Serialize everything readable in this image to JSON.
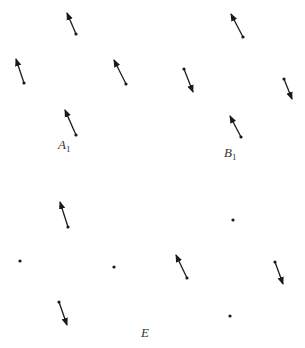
{
  "figure": {
    "width": 305,
    "height": 348,
    "background": "#ffffff",
    "stroke_color": "#1a1a1a",
    "groups": [
      {
        "id": "A1",
        "label": {
          "main": "A",
          "sub": "1",
          "x": 58,
          "y": 138
        },
        "vectors": [
          {
            "tail": [
              76,
              34
            ],
            "head": [
              67,
              13
            ]
          },
          {
            "tail": [
              24,
              83
            ],
            "head": [
              16,
              59
            ]
          },
          {
            "tail": [
              126,
              84
            ],
            "head": [
              114,
              60
            ]
          },
          {
            "tail": [
              76,
              135
            ],
            "head": [
              65,
              110
            ]
          }
        ],
        "points": []
      },
      {
        "id": "B1",
        "label": {
          "main": "B",
          "sub": "1",
          "x": 224,
          "y": 146
        },
        "vectors": [
          {
            "tail": [
              243,
              37
            ],
            "head": [
              231,
              14
            ]
          },
          {
            "tail": [
              184,
              69
            ],
            "head": [
              193,
              92
            ]
          },
          {
            "tail": [
              284,
              79
            ],
            "head": [
              292,
              99
            ]
          },
          {
            "tail": [
              241,
              137
            ],
            "head": [
              230,
              116
            ]
          }
        ],
        "points": []
      },
      {
        "id": "E",
        "label": {
          "main": "E",
          "sub": "",
          "x": 141,
          "y": 326
        },
        "vectors": [
          {
            "tail": [
              68,
              227
            ],
            "head": [
              60,
              202
            ]
          },
          {
            "tail": [
              59,
              302
            ],
            "head": [
              67,
              325
            ]
          },
          {
            "tail": [
              187,
              278
            ],
            "head": [
              176,
              255
            ]
          },
          {
            "tail": [
              275,
              262
            ],
            "head": [
              283,
              284
            ]
          }
        ],
        "points": [
          [
            20,
            261
          ],
          [
            114,
            267
          ],
          [
            233,
            220
          ],
          [
            230,
            316
          ]
        ]
      }
    ]
  }
}
